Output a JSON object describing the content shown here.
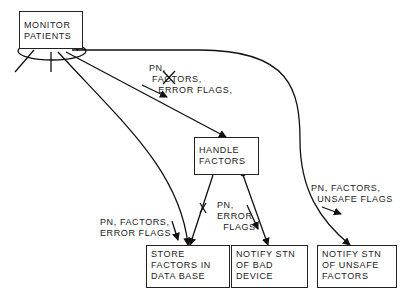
{
  "diagram": {
    "nodes": {
      "monitor": {
        "label": "MONITOR\nPATIENTS"
      },
      "handle": {
        "label": "HANDLE\nFACTORS"
      },
      "store": {
        "label": "STORE\nFACTORS IN\nDATA BASE"
      },
      "bad_device": {
        "label": "NOTIFY STN\nOF BAD\nDEVICE"
      },
      "unsafe": {
        "label": "NOTIFY STN\nOF UNSAFE\nFACTORS"
      }
    },
    "flows": {
      "monitor_to_handle": "PN,\n FACTORS,\n   ERROR FLAGS,",
      "to_store": "PN, FACTORS,\nERROR FLAGS",
      "to_bad_device": "PN,\nERROR\n  FLAGS",
      "to_unsafe": "PN, FACTORS,\n  UNSAFE FLAGS"
    }
  }
}
